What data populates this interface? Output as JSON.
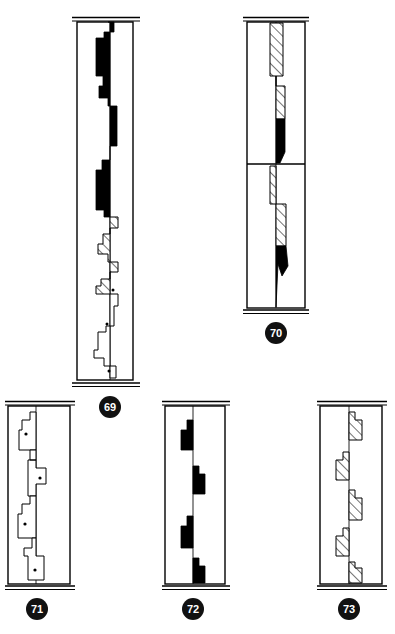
{
  "plate": {
    "title": "",
    "background_color": "#ffffff",
    "ink_color": "#000000",
    "figure_count": 5
  },
  "legend": {
    "fill_solid": "solid-black",
    "fill_hatch": "diagonal-hatch",
    "fill_white_dot": "white-with-dot"
  },
  "figures": [
    {
      "id": "fig-69",
      "label": "69",
      "frame": {
        "x": 77,
        "y": 22,
        "width": 56,
        "height": 358
      },
      "centerline_x": 110,
      "cap_top": true,
      "cap_bottom": true,
      "divider_y": null,
      "regions": [
        {
          "name": "solid-band-upper",
          "fill": "solid-black",
          "y_start": 22,
          "y_end": 205
        },
        {
          "name": "hatched-band-middle",
          "fill": "diagonal-hatch",
          "y_start": 205,
          "y_end": 272
        },
        {
          "name": "dotted-band-lower",
          "fill": "white-with-dot",
          "y_start": 272,
          "y_end": 380
        }
      ],
      "dot_markers": [
        {
          "x": 112,
          "y": 290
        },
        {
          "x": 106,
          "y": 324
        },
        {
          "x": 115,
          "y": 369
        }
      ]
    },
    {
      "id": "fig-70",
      "label": "70",
      "frame": {
        "x": 246,
        "y": 18,
        "width": 58,
        "height": 290
      },
      "centerline_x": 275,
      "cap_top": true,
      "cap_bottom": true,
      "divider_y": 162,
      "regions": [
        {
          "name": "hatched-band-upper",
          "fill": "diagonal-hatch",
          "y_start": 18,
          "y_end": 118
        },
        {
          "name": "solid-band-upper",
          "fill": "solid-black",
          "y_start": 118,
          "y_end": 162
        },
        {
          "name": "hatched-band-lower",
          "fill": "diagonal-hatch",
          "y_start": 162,
          "y_end": 262
        },
        {
          "name": "solid-band-lower",
          "fill": "solid-black",
          "y_start": 262,
          "y_end": 305
        }
      ],
      "dot_markers": []
    },
    {
      "id": "fig-71",
      "label": "71",
      "frame": {
        "x": 8,
        "y": 403,
        "width": 62,
        "height": 186
      },
      "centerline_x": 36,
      "cap_top": true,
      "cap_bottom": true,
      "divider_y": null,
      "regions": [
        {
          "name": "dotted-block-1",
          "fill": "white-with-dot",
          "y_start": 415,
          "y_end": 452
        },
        {
          "name": "dotted-block-2",
          "fill": "white-with-dot",
          "y_start": 452,
          "y_end": 500
        },
        {
          "name": "dotted-block-3",
          "fill": "white-with-dot",
          "y_start": 500,
          "y_end": 548
        },
        {
          "name": "dotted-block-4",
          "fill": "white-with-dot",
          "y_start": 548,
          "y_end": 585
        }
      ],
      "dot_markers": [
        {
          "x": 31,
          "y": 438
        },
        {
          "x": 41,
          "y": 482
        },
        {
          "x": 31,
          "y": 527
        },
        {
          "x": 39,
          "y": 576
        }
      ]
    },
    {
      "id": "fig-72",
      "label": "72",
      "frame": {
        "x": 165,
        "y": 403,
        "width": 60,
        "height": 186
      },
      "centerline_x": 193,
      "cap_top": true,
      "cap_bottom": true,
      "divider_y": null,
      "regions": [
        {
          "name": "solid-block-1",
          "fill": "solid-black",
          "y_start": 425,
          "y_end": 455
        },
        {
          "name": "solid-block-2",
          "fill": "solid-black",
          "y_start": 470,
          "y_end": 500
        },
        {
          "name": "solid-block-3",
          "fill": "solid-black",
          "y_start": 521,
          "y_end": 552
        },
        {
          "name": "solid-block-4",
          "fill": "solid-black",
          "y_start": 563,
          "y_end": 589
        }
      ],
      "dot_markers": []
    },
    {
      "id": "fig-73",
      "label": "73",
      "frame": {
        "x": 320,
        "y": 403,
        "width": 62,
        "height": 186
      },
      "centerline_x": 349,
      "cap_top": true,
      "cap_bottom": true,
      "divider_y": null,
      "regions": [
        {
          "name": "hatched-block-1",
          "fill": "diagonal-hatch",
          "y_start": 413,
          "y_end": 450
        },
        {
          "name": "hatched-block-2",
          "fill": "diagonal-hatch",
          "y_start": 455,
          "y_end": 492
        },
        {
          "name": "hatched-block-3",
          "fill": "diagonal-hatch",
          "y_start": 497,
          "y_end": 534
        },
        {
          "name": "hatched-block-4",
          "fill": "diagonal-hatch",
          "y_start": 536,
          "y_end": 572
        },
        {
          "name": "hatched-block-5",
          "fill": "diagonal-hatch",
          "y_start": 572,
          "y_end": 589
        }
      ],
      "dot_markers": []
    }
  ],
  "labels": {
    "fig69": "69",
    "fig70": "70",
    "fig71": "71",
    "fig72": "72",
    "fig73": "73"
  }
}
